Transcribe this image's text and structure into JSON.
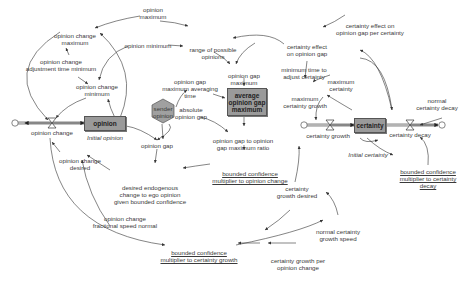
{
  "diagram": {
    "type": "stock-and-flow",
    "colors": {
      "stock_fill": "#9a9a9a",
      "line": "#444444",
      "pipe": "#888888",
      "shadow_var": "#a0a0a0"
    },
    "stocks": {
      "opinion": "opinion",
      "average_gap": "average\nopinion gap\nmaximum",
      "certainty": "certainty"
    },
    "shadow_variable": "sender\nopinion",
    "flows": {
      "opinion_change": "opinion change",
      "certainty_growth": "certainty growth",
      "certainty_decay": "certainty decay"
    },
    "initial_values": {
      "initial_opinion": "Initial opinion",
      "initial_certainty": "Initial certainty"
    },
    "variables": {
      "opinion_maximum": "opinion\nmaximum",
      "opinion_minimum": "opinion minimum",
      "opinion_change_maximum": "opinion change\nmaximum",
      "opinion_change_adj_time": "opinion change\nadjustment time minimum",
      "opinion_change_minimum": "opinion change\nminimum",
      "range_of_possible": "range of possible\nopinions",
      "opinion_gap_maximum": "opinion gap\nmaximum",
      "opinion_gap_max_avg_time": "opinion gap\nmaximum averaging\ntime",
      "absolute_opinion_gap": "absolute\nopinion gap",
      "opinion_gap": "opinion gap",
      "opinion_gap_ratio": "opinion gap to opinion\ngap maximum ratio",
      "opinion_change_desired": "opinion change\ndesired",
      "desired_endogenous": "desired endogenous\nchange to ego opinion\ngiven bounded confidence",
      "opinion_change_frac_speed": "opinion change\nfractional speed normal",
      "certainty_effect_per": "certainty effect on\nopinion gap per certainty",
      "certainty_effect": "certainty effect\non opinion gap",
      "min_time_adjust_certainty": "minimum time to\nadjust certainty",
      "maximum_certainty": "maximum\ncertainty",
      "maximum_certainty_growth": "maximum\ncertainty growth",
      "normal_certainty_decay": "normal\ncertainty decay",
      "certainty_growth_desired": "certainty\ngrowth desired",
      "normal_certainty_growth_speed": "normal certainty\ngrowth speed",
      "certainty_growth_per_opinion_change": "certainty growth per\nopinion change"
    },
    "lookups": {
      "bc_mult_opinion_change": "bounded confidence\nmultiplier to opinion change",
      "bc_mult_certainty_decay": "bounded confidence\nmultiplier to certainty\ndecay",
      "bc_mult_certainty_growth": "bounded confidence\nmultiplier to certainty growth"
    }
  }
}
